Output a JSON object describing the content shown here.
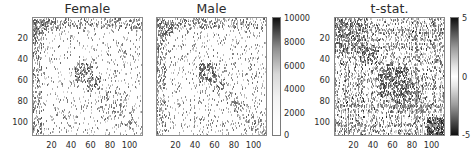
{
  "figure": {
    "width": 476,
    "height": 166,
    "background": "#ffffff"
  },
  "chart_data": [
    {
      "type": "heatmap",
      "title": "Female",
      "xlabel": "",
      "ylabel": "",
      "xlim": [
        0,
        114
      ],
      "ylim": [
        0,
        114
      ],
      "xticks": [
        20,
        40,
        60,
        80,
        100
      ],
      "yticks": [
        20,
        40,
        60,
        80,
        100
      ],
      "grid": false,
      "colormap": "grayscale-sequential",
      "colorbar": null,
      "description": "Sparse symmetric connectivity matrix, dark entries on white background; dense diagonal clusters near indices 5-15 and 45-60, scattered off-diagonal entries trailing toward 90-110."
    },
    {
      "type": "heatmap",
      "title": "Male",
      "xlabel": "",
      "ylabel": "",
      "xlim": [
        0,
        114
      ],
      "ylim": [
        0,
        114
      ],
      "xticks": [
        20,
        40,
        60,
        80,
        100
      ],
      "yticks": [
        20,
        40,
        60,
        80,
        100
      ],
      "grid": false,
      "colormap": "grayscale-sequential",
      "colorbar": {
        "min": 0,
        "max": 10000,
        "ticks": [
          0,
          2000,
          4000,
          6000,
          8000,
          10000
        ],
        "tick_labels": [
          "0",
          "2000",
          "4000",
          "6000",
          "8000",
          "10000"
        ],
        "orientation": "vertical",
        "position": "right",
        "low_color": "#ffffff",
        "high_color": "#111111"
      },
      "description": "Sparse symmetric connectivity matrix with similar structure to the Female panel; dense cluster around indices 45-60."
    },
    {
      "type": "heatmap",
      "title": "t-stat.",
      "xlabel": "",
      "ylabel": "",
      "xlim": [
        0,
        114
      ],
      "ylim": [
        0,
        114
      ],
      "xticks": [
        20,
        40,
        60,
        80,
        100
      ],
      "yticks": [
        20,
        40,
        60,
        80,
        100
      ],
      "grid": false,
      "colormap": "grayscale-diverging",
      "colorbar": {
        "min": -5,
        "max": 5,
        "ticks": [
          -5,
          0,
          5
        ],
        "tick_labels": [
          "-5",
          "0",
          "5"
        ],
        "orientation": "vertical",
        "position": "right",
        "low_color": "#0f0f0f",
        "mid_color": "#ffffff",
        "high_color": "#0f0f0f"
      },
      "description": "Dense t-statistic matrix; widespread speckled structure across the full matrix with a strongly populated block in the lower-right corner (indices ~95-114)."
    }
  ],
  "panels": [
    {
      "name": "female",
      "title": "Female",
      "xticks": [
        "20",
        "40",
        "60",
        "80",
        "100"
      ],
      "yticks": [
        "20",
        "40",
        "60",
        "80",
        "100"
      ]
    },
    {
      "name": "male",
      "title": "Male",
      "xticks": [
        "20",
        "40",
        "60",
        "80",
        "100"
      ],
      "yticks": []
    },
    {
      "name": "tstat",
      "title": "t-stat.",
      "xticks": [
        "20",
        "40",
        "60",
        "80",
        "100"
      ],
      "yticks": [
        "20",
        "40",
        "60",
        "80",
        "100"
      ]
    }
  ],
  "colorbars": [
    {
      "name": "count-colorbar",
      "labels": [
        "10000",
        "8000",
        "6000",
        "4000",
        "2000",
        "0"
      ]
    },
    {
      "name": "tstat-colorbar",
      "labels": [
        "5",
        "0",
        "-5"
      ]
    }
  ]
}
